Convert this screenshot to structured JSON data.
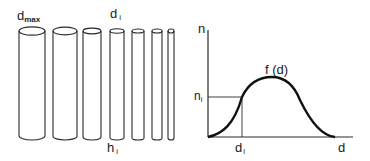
{
  "left_panel": {
    "label_dmax": "d",
    "label_dmax_sub": "max",
    "label_di": "d",
    "label_di_sub": "i",
    "label_hi": "h",
    "label_hi_sub": "i",
    "cylinders": [
      {
        "x": 19,
        "w": 26
      },
      {
        "x": 53,
        "w": 24
      },
      {
        "x": 83,
        "w": 18
      },
      {
        "x": 110,
        "w": 14
      },
      {
        "x": 132,
        "w": 12
      },
      {
        "x": 152,
        "w": 10
      },
      {
        "x": 168,
        "w": 6
      }
    ]
  },
  "chart": {
    "y_axis_label": "n",
    "x_axis_label": "d",
    "curve_label": "f (d)",
    "marker_y_label": "n",
    "marker_y_sub": "i",
    "marker_x_label": "d",
    "marker_x_sub": "i"
  },
  "chart_data": {
    "type": "line",
    "title": "",
    "xlabel": "d",
    "ylabel": "n",
    "series": [
      {
        "name": "f (d)",
        "x": [
          0,
          0.1,
          0.2,
          0.25,
          0.3,
          0.4,
          0.45,
          0.5,
          0.6,
          0.7,
          0.8,
          0.9,
          1.0
        ],
        "values": [
          0,
          0.08,
          0.3,
          0.5,
          0.7,
          0.88,
          0.9,
          0.88,
          0.7,
          0.45,
          0.2,
          0.04,
          0
        ]
      }
    ],
    "annotations": [
      {
        "text": "d_i",
        "x": 0.25
      },
      {
        "text": "n_i",
        "y": 0.5
      },
      {
        "text": "f (d)",
        "note": "curve label near peak"
      }
    ],
    "grid": false,
    "legend": "none"
  },
  "colors": {
    "line": "#1a1a1a",
    "background": "#ffffff"
  }
}
